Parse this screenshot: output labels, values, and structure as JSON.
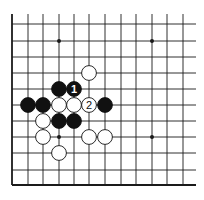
{
  "diagram": {
    "type": "go-board-fragment",
    "background": "#ffffff",
    "line_color": "#1a1a1a",
    "grid": {
      "columns_x": [
        12,
        28,
        43,
        59,
        74,
        89,
        105,
        121,
        136,
        152,
        167,
        183
      ],
      "rows_y": [
        24,
        41,
        57,
        73,
        89,
        105,
        121,
        137,
        153,
        170,
        185
      ],
      "line_top_y": 14,
      "line_right_x": 196,
      "left_edge": true,
      "bottom_edge": true
    },
    "star_points": [
      {
        "col": 3,
        "row": 1
      },
      {
        "col": 9,
        "row": 1
      },
      {
        "col": 3,
        "row": 7
      },
      {
        "col": 9,
        "row": 7
      }
    ],
    "stones": [
      {
        "color": "white",
        "col": 5,
        "row": 3,
        "label": ""
      },
      {
        "color": "black",
        "col": 3,
        "row": 4,
        "label": ""
      },
      {
        "color": "black",
        "col": 4,
        "row": 4,
        "label": "1"
      },
      {
        "color": "black",
        "col": 1,
        "row": 5,
        "label": ""
      },
      {
        "color": "black",
        "col": 2,
        "row": 5,
        "label": ""
      },
      {
        "color": "white",
        "col": 3,
        "row": 5,
        "label": ""
      },
      {
        "color": "white",
        "col": 4,
        "row": 5,
        "label": ""
      },
      {
        "color": "white",
        "col": 5,
        "row": 5,
        "label": "2"
      },
      {
        "color": "black",
        "col": 6,
        "row": 5,
        "label": ""
      },
      {
        "color": "white",
        "col": 2,
        "row": 6,
        "label": ""
      },
      {
        "color": "black",
        "col": 3,
        "row": 6,
        "label": ""
      },
      {
        "color": "black",
        "col": 4,
        "row": 6,
        "label": ""
      },
      {
        "color": "white",
        "col": 2,
        "row": 7,
        "label": ""
      },
      {
        "color": "white",
        "col": 5,
        "row": 7,
        "label": ""
      },
      {
        "color": "white",
        "col": 6,
        "row": 7,
        "label": ""
      },
      {
        "color": "white",
        "col": 3,
        "row": 8,
        "label": ""
      }
    ],
    "move_labels": [
      "1",
      "2"
    ]
  }
}
